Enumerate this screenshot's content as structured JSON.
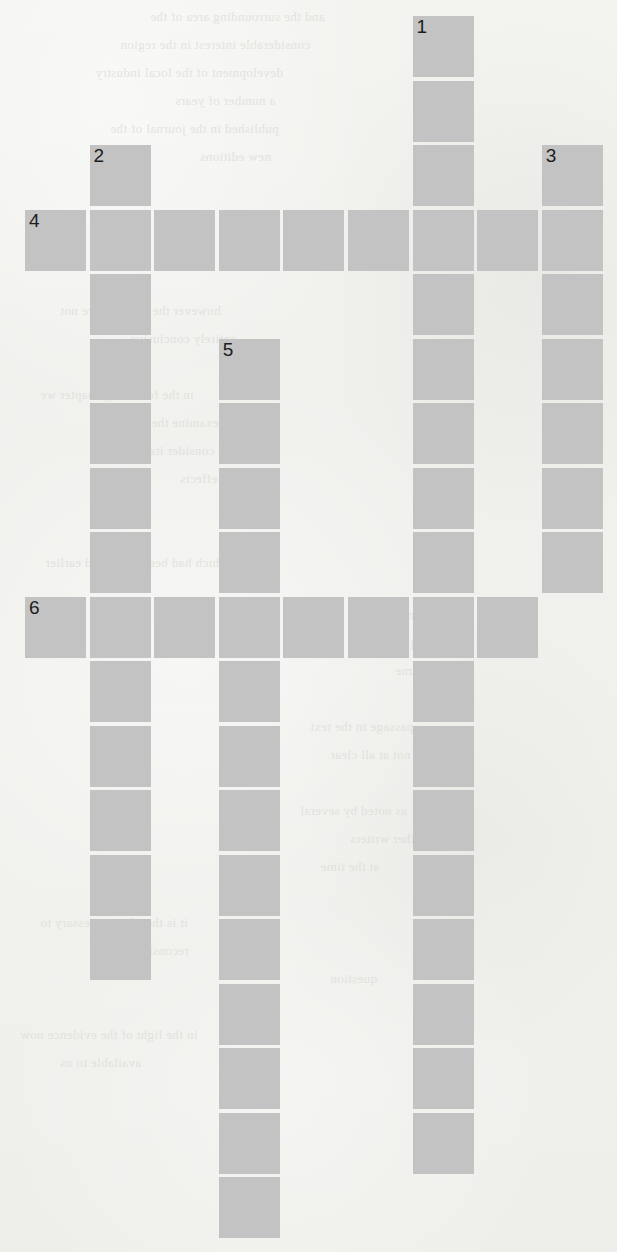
{
  "puzzle": {
    "kind": "crossword-grid",
    "cell_color": "#c3c3c3",
    "page_color": "#f1f1ee",
    "number_color": "#1d1d1d",
    "geometry": {
      "origin_x": 25,
      "origin_y": 16,
      "cell_size": 61,
      "pitch_x": 64.6,
      "pitch_y": 64.5,
      "columns": 9,
      "rows": 19
    },
    "clue_numbers": [
      "1",
      "2",
      "3",
      "4",
      "5",
      "6"
    ],
    "entries": [
      {
        "number": "1",
        "direction": "down",
        "col": 6,
        "row": 0,
        "length": 18
      },
      {
        "number": "2",
        "direction": "down",
        "col": 1,
        "row": 2,
        "length": 13
      },
      {
        "number": "3",
        "direction": "down",
        "col": 8,
        "row": 2,
        "length": 7
      },
      {
        "number": "4",
        "direction": "across",
        "col": 0,
        "row": 3,
        "length": 9
      },
      {
        "number": "5",
        "direction": "down",
        "col": 3,
        "row": 5,
        "length": 14
      },
      {
        "number": "6",
        "direction": "across",
        "col": 0,
        "row": 9,
        "length": 8
      }
    ],
    "cells": [
      {
        "col": 6,
        "row": 0,
        "number": "1"
      },
      {
        "col": 6,
        "row": 1,
        "number": ""
      },
      {
        "col": 1,
        "row": 2,
        "number": "2"
      },
      {
        "col": 6,
        "row": 2,
        "number": ""
      },
      {
        "col": 8,
        "row": 2,
        "number": "3"
      },
      {
        "col": 0,
        "row": 3,
        "number": "4"
      },
      {
        "col": 1,
        "row": 3,
        "number": ""
      },
      {
        "col": 2,
        "row": 3,
        "number": ""
      },
      {
        "col": 3,
        "row": 3,
        "number": ""
      },
      {
        "col": 4,
        "row": 3,
        "number": ""
      },
      {
        "col": 5,
        "row": 3,
        "number": ""
      },
      {
        "col": 6,
        "row": 3,
        "number": ""
      },
      {
        "col": 7,
        "row": 3,
        "number": ""
      },
      {
        "col": 8,
        "row": 3,
        "number": ""
      },
      {
        "col": 1,
        "row": 4,
        "number": ""
      },
      {
        "col": 6,
        "row": 4,
        "number": ""
      },
      {
        "col": 8,
        "row": 4,
        "number": ""
      },
      {
        "col": 1,
        "row": 5,
        "number": ""
      },
      {
        "col": 3,
        "row": 5,
        "number": "5"
      },
      {
        "col": 6,
        "row": 5,
        "number": ""
      },
      {
        "col": 8,
        "row": 5,
        "number": ""
      },
      {
        "col": 1,
        "row": 6,
        "number": ""
      },
      {
        "col": 3,
        "row": 6,
        "number": ""
      },
      {
        "col": 6,
        "row": 6,
        "number": ""
      },
      {
        "col": 8,
        "row": 6,
        "number": ""
      },
      {
        "col": 1,
        "row": 7,
        "number": ""
      },
      {
        "col": 3,
        "row": 7,
        "number": ""
      },
      {
        "col": 6,
        "row": 7,
        "number": ""
      },
      {
        "col": 8,
        "row": 7,
        "number": ""
      },
      {
        "col": 1,
        "row": 8,
        "number": ""
      },
      {
        "col": 3,
        "row": 8,
        "number": ""
      },
      {
        "col": 6,
        "row": 8,
        "number": ""
      },
      {
        "col": 8,
        "row": 8,
        "number": ""
      },
      {
        "col": 0,
        "row": 9,
        "number": "6"
      },
      {
        "col": 1,
        "row": 9,
        "number": ""
      },
      {
        "col": 2,
        "row": 9,
        "number": ""
      },
      {
        "col": 3,
        "row": 9,
        "number": ""
      },
      {
        "col": 4,
        "row": 9,
        "number": ""
      },
      {
        "col": 5,
        "row": 9,
        "number": ""
      },
      {
        "col": 6,
        "row": 9,
        "number": ""
      },
      {
        "col": 7,
        "row": 9,
        "number": ""
      },
      {
        "col": 1,
        "row": 10,
        "number": ""
      },
      {
        "col": 3,
        "row": 10,
        "number": ""
      },
      {
        "col": 6,
        "row": 10,
        "number": ""
      },
      {
        "col": 1,
        "row": 11,
        "number": ""
      },
      {
        "col": 3,
        "row": 11,
        "number": ""
      },
      {
        "col": 6,
        "row": 11,
        "number": ""
      },
      {
        "col": 1,
        "row": 12,
        "number": ""
      },
      {
        "col": 3,
        "row": 12,
        "number": ""
      },
      {
        "col": 6,
        "row": 12,
        "number": ""
      },
      {
        "col": 1,
        "row": 13,
        "number": ""
      },
      {
        "col": 3,
        "row": 13,
        "number": ""
      },
      {
        "col": 6,
        "row": 13,
        "number": ""
      },
      {
        "col": 1,
        "row": 14,
        "number": ""
      },
      {
        "col": 3,
        "row": 14,
        "number": ""
      },
      {
        "col": 6,
        "row": 14,
        "number": ""
      },
      {
        "col": 3,
        "row": 15,
        "number": ""
      },
      {
        "col": 6,
        "row": 15,
        "number": ""
      },
      {
        "col": 3,
        "row": 16,
        "number": ""
      },
      {
        "col": 6,
        "row": 16,
        "number": ""
      },
      {
        "col": 3,
        "row": 17,
        "number": ""
      },
      {
        "col": 6,
        "row": 17,
        "number": ""
      },
      {
        "col": 3,
        "row": 18,
        "number": ""
      }
    ]
  },
  "background_bleed": {
    "note": "faint mirrored text bleeding through from the reverse of the printed page",
    "lines": [
      {
        "x": 150,
        "y": 2,
        "text": "and the surrounding area of the"
      },
      {
        "x": 120,
        "y": 30,
        "text": "considerable interest in the region"
      },
      {
        "x": 95,
        "y": 58,
        "text": "development of the local industry"
      },
      {
        "x": 175,
        "y": 86,
        "text": "a number of years"
      },
      {
        "x": 110,
        "y": 114,
        "text": "published in the journal of the"
      },
      {
        "x": 200,
        "y": 142,
        "text": "new editions"
      },
      {
        "x": 60,
        "y": 296,
        "text": "however the results were not"
      },
      {
        "x": 130,
        "y": 324,
        "text": "entirely conclusive"
      },
      {
        "x": 40,
        "y": 380,
        "text": "in the following chapter we"
      },
      {
        "x": 120,
        "y": 408,
        "text": "examine the main"
      },
      {
        "x": 150,
        "y": 436,
        "text": "and consider its"
      },
      {
        "x": 180,
        "y": 464,
        "text": "wider effects"
      },
      {
        "x": 230,
        "y": 492,
        "text": "on the"
      },
      {
        "x": 45,
        "y": 548,
        "text": "which had been described earlier"
      },
      {
        "x": 400,
        "y": 600,
        "text": "a second"
      },
      {
        "x": 410,
        "y": 628,
        "text": "reading"
      },
      {
        "x": 395,
        "y": 656,
        "text": "of the same"
      },
      {
        "x": 310,
        "y": 712,
        "text": "passage in the text"
      },
      {
        "x": 330,
        "y": 740,
        "text": "is not at all clear"
      },
      {
        "x": 300,
        "y": 796,
        "text": "as noted by several"
      },
      {
        "x": 350,
        "y": 824,
        "text": "other writers"
      },
      {
        "x": 320,
        "y": 852,
        "text": "at the time"
      },
      {
        "x": 40,
        "y": 908,
        "text": "it is therefore necessary to"
      },
      {
        "x": 110,
        "y": 936,
        "text": "reconsider the"
      },
      {
        "x": 330,
        "y": 964,
        "text": "question"
      },
      {
        "x": 20,
        "y": 1020,
        "text": "in the light of the evidence now"
      },
      {
        "x": 60,
        "y": 1048,
        "text": "available to us"
      }
    ]
  }
}
